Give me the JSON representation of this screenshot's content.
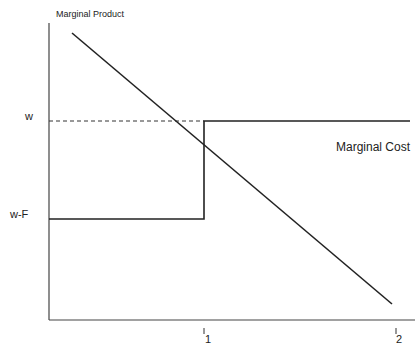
{
  "diagram": {
    "y_axis_label": "Marginal Product",
    "y_ticks": [
      {
        "label": "w"
      },
      {
        "label": "w-F"
      }
    ],
    "x_ticks": [
      {
        "label": "1"
      },
      {
        "label": "2"
      }
    ],
    "curve_labels": {
      "marginal_cost": "Marginal Cost"
    },
    "colors": {
      "line": "#222222",
      "background": "#ffffff"
    }
  }
}
